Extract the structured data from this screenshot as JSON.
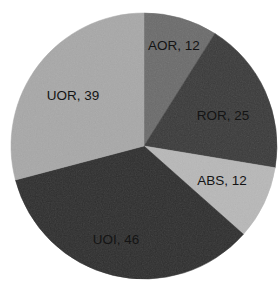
{
  "chart_data": {
    "type": "pie",
    "title": "",
    "subtitle": "",
    "xlabel": "",
    "ylabel": "",
    "legend_position": "none",
    "grid": false,
    "total": 134,
    "start_angle_deg": 0,
    "direction": "clockwise",
    "categories": [
      "AOR",
      "ROR",
      "ABS",
      "UOI",
      "UOR"
    ],
    "values": [
      12,
      25,
      12,
      46,
      39
    ],
    "labels": [
      "AOR, 12",
      "ROR, 25",
      "ABS, 12",
      "UOI, 46",
      "UOR, 39"
    ],
    "slices": [
      {
        "name": "AOR",
        "value": 12,
        "label": "AOR, 12",
        "color": "#6b6b6b",
        "percent": 9.0,
        "start_deg": 0,
        "end_deg": 32.2,
        "label_x": 174,
        "label_y": 46
      },
      {
        "name": "ROR",
        "value": 25,
        "label": "ROR, 25",
        "color": "#3a3a3a",
        "percent": 18.7,
        "start_deg": 32.2,
        "end_deg": 99.4,
        "label_x": 223,
        "label_y": 116
      },
      {
        "name": "ABS",
        "value": 12,
        "label": "ABS, 12",
        "color": "#b8b8b8",
        "percent": 9.0,
        "start_deg": 99.4,
        "end_deg": 131.6,
        "label_x": 222,
        "label_y": 181
      },
      {
        "name": "UOI",
        "value": 46,
        "label": "UOI, 46",
        "color": "#2e2e2e",
        "percent": 34.3,
        "start_deg": 131.6,
        "end_deg": 255.2,
        "label_x": 116,
        "label_y": 240
      },
      {
        "name": "UOR",
        "value": 39,
        "label": "UOR, 39",
        "color": "#a8a8a8",
        "percent": 29.1,
        "start_deg": 255.2,
        "end_deg": 360,
        "label_x": 73,
        "label_y": 96
      }
    ],
    "geometry": {
      "center_x": 144,
      "center_y": 146,
      "radius": 133
    },
    "background_color": "#ffffff",
    "label_color": "#141414"
  }
}
